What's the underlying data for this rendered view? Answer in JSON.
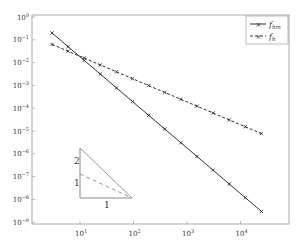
{
  "chart_data": {
    "type": "line",
    "title": "",
    "xlabel": "",
    "ylabel": "",
    "xscale": "log",
    "yscale": "log",
    "xlim": [
      1.7,
      60000
    ],
    "ylim": [
      1e-09,
      1
    ],
    "x_ticks": [
      {
        "value": 10,
        "label_base": "10",
        "label_exp": "1"
      },
      {
        "value": 100,
        "label_base": "10",
        "label_exp": "2"
      },
      {
        "value": 1000,
        "label_base": "10",
        "label_exp": "3"
      },
      {
        "value": 10000,
        "label_base": "10",
        "label_exp": "4"
      }
    ],
    "y_ticks": [
      {
        "value": 1,
        "label_base": "10",
        "label_exp": "0"
      },
      {
        "value": 0.1,
        "label_base": "10",
        "label_exp": "−1"
      },
      {
        "value": 0.01,
        "label_base": "10",
        "label_exp": "−2"
      },
      {
        "value": 0.001,
        "label_base": "10",
        "label_exp": "−3"
      },
      {
        "value": 0.0001,
        "label_base": "10",
        "label_exp": "−4"
      },
      {
        "value": 1e-05,
        "label_base": "10",
        "label_exp": "−5"
      },
      {
        "value": 1e-06,
        "label_base": "10",
        "label_exp": "−6"
      },
      {
        "value": 1e-07,
        "label_base": "10",
        "label_exp": "−7"
      },
      {
        "value": 1e-08,
        "label_base": "10",
        "label_exp": "−8"
      },
      {
        "value": 1e-09,
        "label_base": "10",
        "label_exp": "−9"
      }
    ],
    "x": [
      3,
      6,
      12,
      24,
      48,
      96,
      192,
      384,
      768,
      1536,
      3072,
      6144,
      12288,
      24576
    ],
    "series": [
      {
        "name": "f_hm",
        "label_main": "f",
        "label_sub": "hm",
        "style": "solid",
        "marker": "x",
        "color": "#333333",
        "values": [
          0.2,
          0.05,
          0.0125,
          0.003125,
          0.00078,
          0.000195,
          4.88e-05,
          1.22e-05,
          3.05e-06,
          7.63e-07,
          1.91e-07,
          4.77e-08,
          1.19e-08,
          2.98e-09
        ]
      },
      {
        "name": "f_h",
        "label_main": "f",
        "label_sub": "h",
        "style": "dashed",
        "marker": "x",
        "color": "#333333",
        "values": [
          0.063,
          0.0315,
          0.0158,
          0.00788,
          0.00394,
          0.00197,
          0.000984,
          0.000492,
          0.000246,
          0.000123,
          6.15e-05,
          3.08e-05,
          1.54e-05,
          7.7e-06
        ]
      }
    ],
    "legend": {
      "position": "upper right"
    },
    "grid": false,
    "annotation": {
      "type": "slope-triangle",
      "vertical_labels": [
        "2",
        "1"
      ],
      "horizontal_label": "1"
    }
  }
}
